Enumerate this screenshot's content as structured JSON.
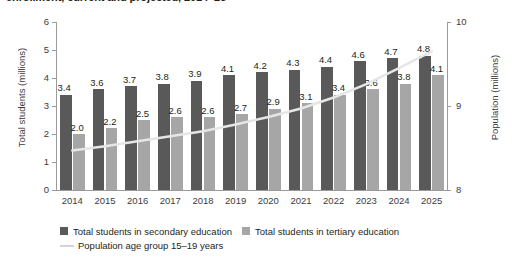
{
  "title": "enrollment, current and projected, 2014–25",
  "colors": {
    "secondary_bar": "#595959",
    "tertiary_bar": "#a6a6a6",
    "line": "#e6e6e6",
    "axis": "#9a9a9a",
    "text": "#231f20",
    "background": "#ffffff"
  },
  "chart_data": {
    "type": "bar",
    "title": "enrollment, current and projected, 2014–25",
    "xlabel": "",
    "ylabel": "Total students (millions)",
    "y2label": "Population (millions)",
    "ylim": [
      0,
      6
    ],
    "y2lim": [
      8,
      10
    ],
    "yticks": [
      "0",
      "1",
      "2",
      "3",
      "4",
      "5",
      "6"
    ],
    "y2ticks": [
      "8",
      "9",
      "10"
    ],
    "grid": false,
    "legend_position": "bottom",
    "categories": [
      "2014",
      "2015",
      "2016",
      "2017",
      "2018",
      "2019",
      "2020",
      "2021",
      "2022",
      "2023",
      "2024",
      "2025"
    ],
    "series": [
      {
        "name": "Total students in secondary education",
        "type": "bar",
        "axis": "left",
        "color": "#595959",
        "values": [
          3.4,
          3.6,
          3.7,
          3.8,
          3.9,
          4.1,
          4.2,
          4.3,
          4.4,
          4.6,
          4.7,
          4.8
        ],
        "labels": [
          "3.4",
          "3.6",
          "3.7",
          "3.8",
          "3.9",
          "4.1",
          "4.2",
          "4.3",
          "4.4",
          "4.6",
          "4.7",
          "4.8"
        ]
      },
      {
        "name": "Total students in tertiary education",
        "type": "bar",
        "axis": "left",
        "color": "#a6a6a6",
        "values": [
          2.0,
          2.2,
          2.5,
          2.6,
          2.6,
          2.7,
          2.9,
          3.1,
          3.4,
          3.6,
          3.8,
          4.1
        ],
        "labels": [
          "2.0",
          "2.2",
          "2.5",
          "2.6",
          "2.6",
          "2.7",
          "2.9",
          "3.1",
          "3.4",
          "3.6",
          "3.8",
          "4.1"
        ]
      },
      {
        "name": "Population age group 15–19 years",
        "type": "line",
        "axis": "right",
        "color": "#e6e6e6",
        "values": [
          8.47,
          8.52,
          8.58,
          8.64,
          8.7,
          8.78,
          8.87,
          8.97,
          9.1,
          9.26,
          9.45,
          9.65
        ]
      }
    ]
  },
  "legend": {
    "items": [
      {
        "label": "Total students in secondary education",
        "marker": "square-dark"
      },
      {
        "label": "Total students in tertiary education",
        "marker": "square-light"
      },
      {
        "label": "Population age group 15–19 years",
        "marker": "line"
      }
    ]
  }
}
